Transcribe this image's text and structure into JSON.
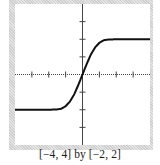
{
  "caption": "[−4, 4] by [−2, 2]",
  "colors": {
    "frame": "#d6d6d6",
    "plot_background": "#ffffff",
    "axis": "#444444",
    "curve": "#111111"
  },
  "chart_data": {
    "type": "line",
    "title": "",
    "caption": "[-4, 4] by [-2, 2]",
    "xlabel": "",
    "ylabel": "",
    "xlim": [
      -4,
      4
    ],
    "ylim": [
      -2,
      2
    ],
    "x_ticks": [
      -4,
      -3,
      -2,
      -1,
      0,
      1,
      2,
      3,
      4
    ],
    "y_ticks": [
      -2,
      -1.5,
      -1,
      -0.5,
      0,
      0.5,
      1,
      1.5,
      2
    ],
    "grid": false,
    "legend": null,
    "series": [
      {
        "name": "f(x)",
        "x": [
          -4,
          -3,
          -2,
          -1.5,
          -1.25,
          -1,
          -0.75,
          -0.5,
          -0.25,
          0,
          0.25,
          0.5,
          0.75,
          1,
          1.25,
          1.5,
          2,
          3,
          4
        ],
        "values": [
          -1,
          -1,
          -1,
          -0.99,
          -0.97,
          -0.9,
          -0.77,
          -0.57,
          -0.3,
          0,
          0.3,
          0.57,
          0.77,
          0.9,
          0.97,
          0.99,
          1,
          1,
          1
        ]
      }
    ]
  }
}
